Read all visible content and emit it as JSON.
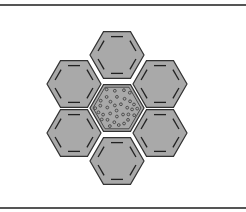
{
  "figure": {
    "width": 246,
    "height": 212,
    "frame": {
      "top_rule_y": 4,
      "bottom_rule_y": 207,
      "color": "#555555"
    },
    "hexagon": {
      "orientation": "flat-top",
      "radius": 27,
      "fill": "#a9a9a9",
      "stroke": "#333333",
      "dash_color": "#222222"
    },
    "cells": [
      {
        "id": "center",
        "cx": 117,
        "cy": 108,
        "pattern": "dots"
      },
      {
        "id": "top",
        "cx": 117,
        "cy": 55,
        "pattern": "dashes"
      },
      {
        "id": "bottom",
        "cx": 117,
        "cy": 161,
        "pattern": "dashes"
      },
      {
        "id": "upper-left",
        "cx": 74,
        "cy": 84,
        "pattern": "dashes"
      },
      {
        "id": "lower-left",
        "cx": 74,
        "cy": 133,
        "pattern": "dashes"
      },
      {
        "id": "upper-right",
        "cx": 160,
        "cy": 84,
        "pattern": "dashes"
      },
      {
        "id": "lower-right",
        "cx": 160,
        "cy": 133,
        "pattern": "dashes"
      }
    ],
    "dot_color": "#444444"
  }
}
